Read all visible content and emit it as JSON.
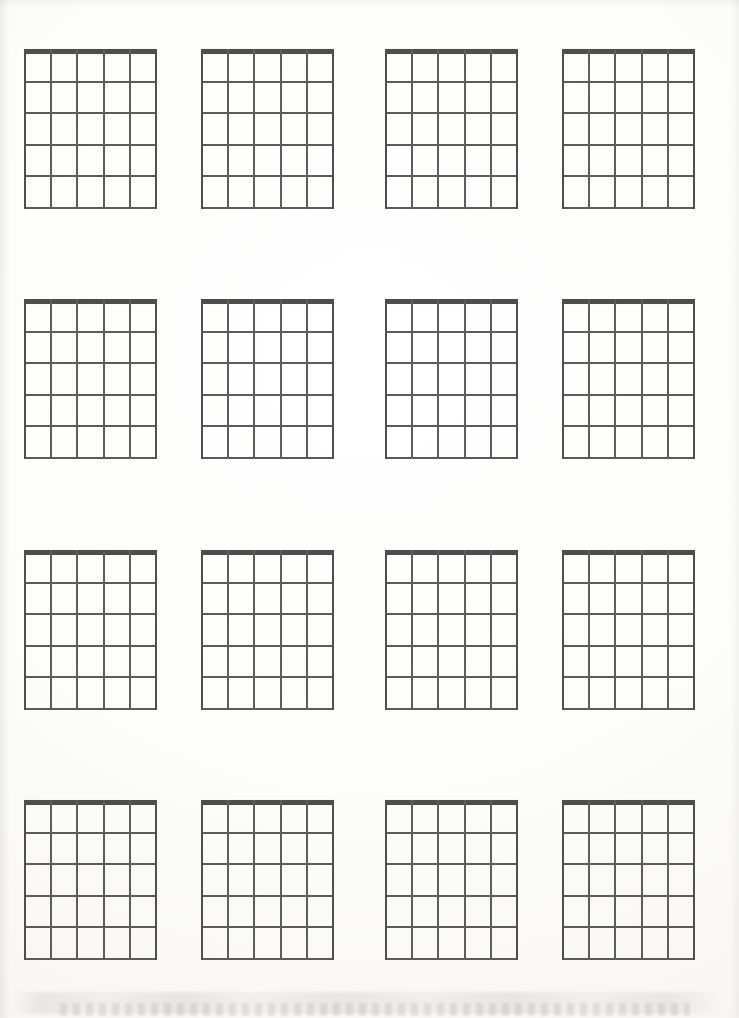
{
  "document": {
    "kind": "blank-guitar-chord-chart-worksheet",
    "page_background_color": "#fbfbfa",
    "ink_color": "#5b5b5b",
    "nut_color": "#4d4d4d",
    "width_px": 739,
    "height_px": 1018
  },
  "layout": {
    "grid_rows": 4,
    "grid_columns": 4,
    "total_diagrams": 16,
    "row_tops_px": [
      49,
      299,
      550,
      800
    ],
    "column_lefts_px": [
      24,
      201,
      385,
      562
    ],
    "diagram_width_px": 131,
    "diagram_height_px": 158
  },
  "diagram_template": {
    "strings": 6,
    "string_labels": [
      "E",
      "A",
      "D",
      "G",
      "B",
      "e"
    ],
    "frets": 5,
    "fret_numbers": [
      "1",
      "2",
      "3",
      "4",
      "5"
    ],
    "nut_shown": true,
    "nut_thickness_px": 5,
    "fret_thickness_px": 2,
    "string_thickness_px": 2,
    "string_spacing_px": 26.2,
    "fret_spacing_px": 31.5,
    "markers": [],
    "open_muted_row": false,
    "title": ""
  },
  "diagrams": [
    {
      "index": 1,
      "row": 1,
      "column": 1,
      "title": "",
      "markers": []
    },
    {
      "index": 2,
      "row": 1,
      "column": 2,
      "title": "",
      "markers": []
    },
    {
      "index": 3,
      "row": 1,
      "column": 3,
      "title": "",
      "markers": []
    },
    {
      "index": 4,
      "row": 1,
      "column": 4,
      "title": "",
      "markers": []
    },
    {
      "index": 5,
      "row": 2,
      "column": 1,
      "title": "",
      "markers": []
    },
    {
      "index": 6,
      "row": 2,
      "column": 2,
      "title": "",
      "markers": []
    },
    {
      "index": 7,
      "row": 2,
      "column": 3,
      "title": "",
      "markers": []
    },
    {
      "index": 8,
      "row": 2,
      "column": 4,
      "title": "",
      "markers": []
    },
    {
      "index": 9,
      "row": 3,
      "column": 1,
      "title": "",
      "markers": []
    },
    {
      "index": 10,
      "row": 3,
      "column": 2,
      "title": "",
      "markers": []
    },
    {
      "index": 11,
      "row": 3,
      "column": 3,
      "title": "",
      "markers": []
    },
    {
      "index": 12,
      "row": 3,
      "column": 4,
      "title": "",
      "markers": []
    },
    {
      "index": 13,
      "row": 4,
      "column": 1,
      "title": "",
      "markers": []
    },
    {
      "index": 14,
      "row": 4,
      "column": 2,
      "title": "",
      "markers": []
    },
    {
      "index": 15,
      "row": 4,
      "column": 3,
      "title": "",
      "markers": []
    },
    {
      "index": 16,
      "row": 4,
      "column": 4,
      "title": "",
      "markers": []
    }
  ]
}
